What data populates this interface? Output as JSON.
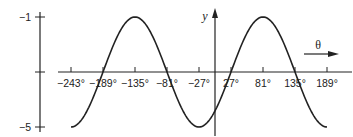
{
  "chart_data": {
    "type": "line",
    "title": "",
    "xlabel": "θ",
    "ylabel": "y",
    "function": "y = -3 + 2cos(5/3·(θ - 81°))",
    "x_ticks": [
      "-243°",
      "-189°",
      "-135°",
      "-81°",
      "-27°",
      "27°",
      "81°",
      "135°",
      "189°"
    ],
    "x_tick_values": [
      -243,
      -189,
      -135,
      -81,
      -27,
      27,
      81,
      135,
      189
    ],
    "y_ticks": [
      "-1",
      "-5"
    ],
    "y_tick_values": [
      -1,
      -5
    ],
    "xlim": [
      -243,
      189
    ],
    "ylim": [
      -5,
      -1
    ],
    "midline": -3,
    "grid": false,
    "series": [
      {
        "name": "curve",
        "x": [
          -243,
          -189,
          -135,
          -81,
          -27,
          27,
          81,
          135,
          189
        ],
        "values": [
          -5,
          -3,
          -1,
          -3,
          -5,
          -3,
          -1,
          -3,
          -5
        ]
      }
    ],
    "annotations": [
      "θ →"
    ]
  },
  "labels": {
    "y_axis": "y",
    "theta_arrow": "θ",
    "y_tick_top": "−1",
    "y_tick_bottom": "−5",
    "x_ticks": [
      "−243°",
      "−189°",
      "−135°",
      "−81°",
      "−27°",
      "27°",
      "81°",
      "135°",
      "189°"
    ]
  }
}
